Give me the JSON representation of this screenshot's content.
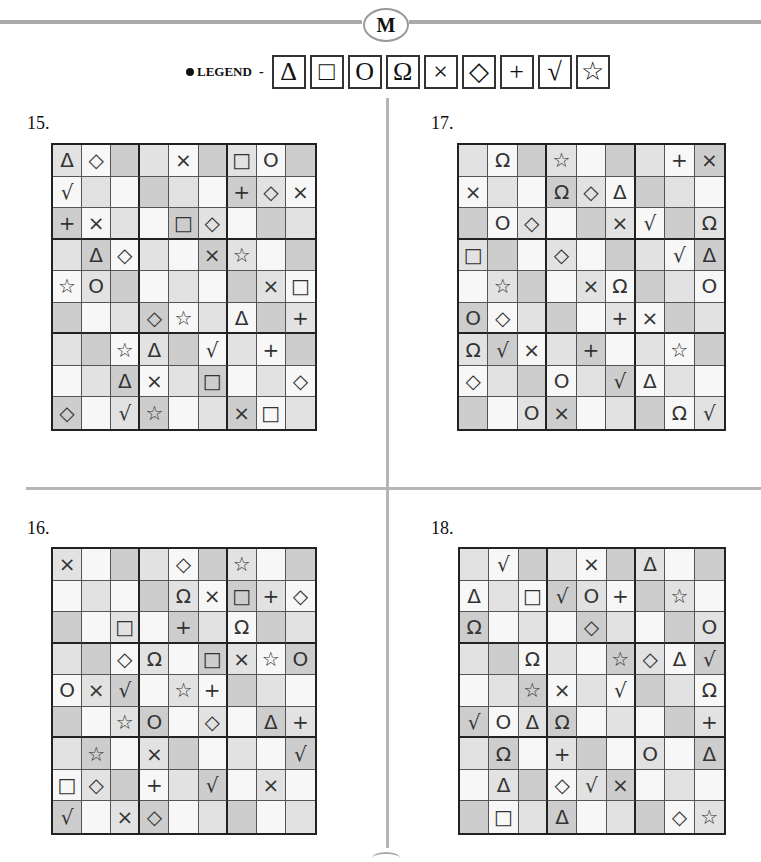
{
  "header": {
    "badge_letter": "M",
    "legend_label": "LEGEND",
    "legend_dash": "-",
    "legend_symbols": [
      {
        "name": "triangle",
        "glyph": "Δ"
      },
      {
        "name": "square",
        "glyph": "□"
      },
      {
        "name": "circle",
        "glyph": "O"
      },
      {
        "name": "omega",
        "glyph": "Ω"
      },
      {
        "name": "cross",
        "glyph": "×"
      },
      {
        "name": "diamond",
        "glyph": "◇"
      },
      {
        "name": "plus",
        "glyph": "+"
      },
      {
        "name": "check",
        "glyph": "√"
      },
      {
        "name": "star",
        "glyph": "☆"
      }
    ]
  },
  "colors": {
    "W": "#f7f7f7",
    "L": "#e2e2e2",
    "D": "#cdcdcd",
    "divider": "#b5b5b5"
  },
  "shading_pattern": [
    [
      "L",
      "W",
      "D",
      "L",
      "W",
      "D",
      "L",
      "W",
      "D"
    ],
    [
      "W",
      "L",
      "W",
      "D",
      "L",
      "W",
      "D",
      "L",
      "W"
    ],
    [
      "D",
      "W",
      "L",
      "W",
      "D",
      "L",
      "W",
      "D",
      "L"
    ],
    [
      "L",
      "D",
      "W",
      "L",
      "W",
      "D",
      "L",
      "W",
      "D"
    ],
    [
      "W",
      "L",
      "D",
      "W",
      "L",
      "W",
      "D",
      "L",
      "W"
    ],
    [
      "D",
      "W",
      "L",
      "D",
      "W",
      "L",
      "W",
      "D",
      "L"
    ],
    [
      "L",
      "D",
      "W",
      "L",
      "D",
      "W",
      "L",
      "W",
      "D"
    ],
    [
      "W",
      "L",
      "D",
      "W",
      "L",
      "D",
      "W",
      "L",
      "W"
    ],
    [
      "D",
      "W",
      "L",
      "D",
      "W",
      "L",
      "D",
      "W",
      "L"
    ]
  ],
  "puzzles": [
    {
      "label": "15.",
      "key": "p15",
      "rows": [
        [
          "Δ",
          "◇",
          "",
          "",
          "×",
          "",
          "□",
          "O",
          ""
        ],
        [
          "√",
          "",
          "",
          "",
          "",
          "",
          "+",
          "◇",
          "×"
        ],
        [
          "+",
          "×",
          "",
          "",
          "□",
          "◇",
          "",
          "",
          ""
        ],
        [
          "",
          "Δ",
          "◇",
          "",
          "",
          "×",
          "☆",
          "",
          ""
        ],
        [
          "☆",
          "O",
          "",
          "",
          "",
          "",
          "",
          "×",
          "□"
        ],
        [
          "",
          "",
          "",
          "◇",
          "☆",
          "",
          "Δ",
          "",
          "+"
        ],
        [
          "",
          "",
          "☆",
          "Δ",
          "",
          "√",
          "",
          "+",
          ""
        ],
        [
          "",
          "",
          "Δ",
          "×",
          "",
          "□",
          "",
          "",
          "◇"
        ],
        [
          "◇",
          "",
          "√",
          "☆",
          "",
          "",
          "×",
          "□",
          ""
        ]
      ]
    },
    {
      "label": "17.",
      "key": "p17",
      "rows": [
        [
          "",
          "Ω",
          "",
          "☆",
          "",
          "",
          "",
          "+",
          "×"
        ],
        [
          "×",
          "",
          "",
          "Ω",
          "◇",
          "Δ",
          "",
          "",
          ""
        ],
        [
          "",
          "O",
          "◇",
          "",
          "",
          "×",
          "√",
          "",
          "Ω"
        ],
        [
          "□",
          "",
          "",
          "◇",
          "",
          "",
          "",
          "√",
          "Δ"
        ],
        [
          "",
          "☆",
          "",
          "",
          "×",
          "Ω",
          "",
          "",
          "O"
        ],
        [
          "O",
          "◇",
          "",
          "",
          "",
          "+",
          "×",
          "",
          ""
        ],
        [
          "Ω",
          "√",
          "×",
          "",
          "+",
          "",
          "",
          "☆",
          ""
        ],
        [
          "◇",
          "",
          "",
          "O",
          "",
          "√",
          "Δ",
          "",
          ""
        ],
        [
          "",
          "",
          "O",
          "×",
          "",
          "",
          "",
          "Ω",
          "√"
        ]
      ]
    },
    {
      "label": "16.",
      "key": "p16",
      "rows": [
        [
          "×",
          "",
          "",
          "",
          "◇",
          "",
          "☆",
          "",
          ""
        ],
        [
          "",
          "",
          "",
          "",
          "Ω",
          "×",
          "□",
          "+",
          "◇"
        ],
        [
          "",
          "",
          "□",
          "",
          "+",
          "",
          "Ω",
          "",
          ""
        ],
        [
          "",
          "",
          "◇",
          "Ω",
          "",
          "□",
          "×",
          "☆",
          "O"
        ],
        [
          "O",
          "×",
          "√",
          "",
          "☆",
          "+",
          "",
          "",
          ""
        ],
        [
          "",
          "",
          "☆",
          "O",
          "",
          "◇",
          "",
          "Δ",
          "+"
        ],
        [
          "",
          "☆",
          "",
          "×",
          "",
          "",
          "",
          "",
          "√"
        ],
        [
          "□",
          "◇",
          "",
          "+",
          "",
          "√",
          "",
          "×",
          ""
        ],
        [
          "√",
          "",
          "×",
          "◇",
          "",
          "",
          "",
          "",
          ""
        ]
      ]
    },
    {
      "label": "18.",
      "key": "p18",
      "rows": [
        [
          "",
          "√",
          "",
          "",
          "×",
          "",
          "Δ",
          "",
          ""
        ],
        [
          "Δ",
          "",
          "□",
          "√",
          "O",
          "+",
          "",
          "☆",
          ""
        ],
        [
          "Ω",
          "",
          "",
          "",
          "◇",
          "",
          "",
          "",
          "O"
        ],
        [
          "",
          "",
          "Ω",
          "",
          "",
          "☆",
          "◇",
          "Δ",
          "√"
        ],
        [
          "",
          "",
          "☆",
          "×",
          "",
          "√",
          "",
          "",
          "Ω"
        ],
        [
          "√",
          "O",
          "Δ",
          "Ω",
          "",
          "",
          "",
          "",
          "+"
        ],
        [
          "",
          "Ω",
          "",
          "+",
          "",
          "",
          "O",
          "",
          "Δ"
        ],
        [
          "",
          "Δ",
          "",
          "◇",
          "√",
          "×",
          "",
          "",
          ""
        ],
        [
          "",
          "□",
          "",
          "Δ",
          "",
          "",
          "",
          "◇",
          "☆"
        ]
      ]
    }
  ]
}
